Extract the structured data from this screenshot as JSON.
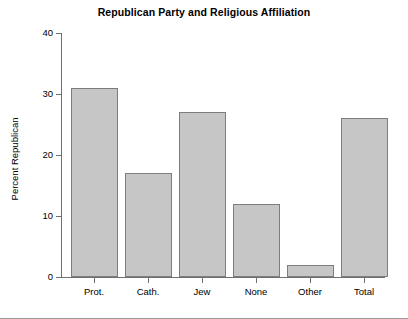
{
  "chart_data": {
    "type": "bar",
    "title": "Republican Party and Religious Affiliation",
    "xlabel": "",
    "ylabel": "Percent Republican",
    "categories": [
      "Prot.",
      "Cath.",
      "Jew",
      "None",
      "Other",
      "Total"
    ],
    "values": [
      31,
      17,
      27,
      12,
      2,
      26
    ],
    "ylim": [
      0,
      40
    ],
    "yticks": [
      0,
      10,
      20,
      30,
      40
    ],
    "grid": false,
    "legend": false,
    "colors": {
      "bar_fill": "#c6c6c6",
      "bar_edge": "#7d7d7d",
      "axis": "#6f6f6f",
      "text": "#000000",
      "background": "#ffffff"
    }
  }
}
